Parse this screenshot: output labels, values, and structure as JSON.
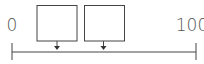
{
  "diagram": {
    "type": "number-line-with-boxes",
    "axis": {
      "min_label": "0",
      "max_label": "100",
      "color": "#444444"
    },
    "boxes": [
      {
        "id": "box-1",
        "label": ""
      },
      {
        "id": "box-2",
        "label": ""
      }
    ],
    "colors": {
      "stroke": "#444444",
      "fill": "#ffffff",
      "text": "#555555"
    }
  }
}
